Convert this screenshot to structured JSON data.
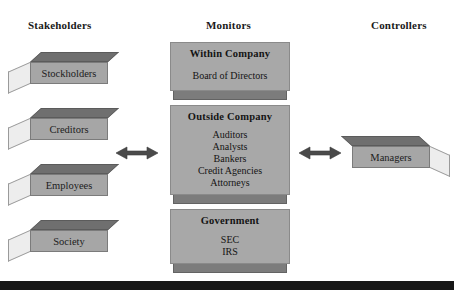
{
  "diagram": {
    "background_color": "#ffffff",
    "box_fill_color": "#a6a6a6",
    "box_top_color": "#6f6f6f",
    "box_side_color": "#ededed",
    "text_color": "#1a1a1a",
    "bottom_band_color": "#171717"
  },
  "columns": {
    "stakeholders": {
      "header": "Stakeholders",
      "boxes": [
        {
          "label": "Stockholders"
        },
        {
          "label": "Creditors"
        },
        {
          "label": "Employees"
        },
        {
          "label": "Society"
        }
      ]
    },
    "monitors": {
      "header": "Monitors",
      "panels": [
        {
          "title": "Within Company",
          "items": [
            "Board of Directors"
          ]
        },
        {
          "title": "Outside Company",
          "items": [
            "Auditors",
            "Analysts",
            "Bankers",
            "Credit Agencies",
            "Attorneys"
          ]
        },
        {
          "title": "Government",
          "items": [
            "SEC",
            "IRS"
          ]
        }
      ]
    },
    "controllers": {
      "header": "Controllers",
      "boxes": [
        {
          "label": "Managers"
        }
      ]
    }
  },
  "connectors": [
    {
      "name": "stakeholders-monitors-arrow",
      "type": "double-arrow"
    },
    {
      "name": "monitors-controllers-arrow",
      "type": "double-arrow"
    }
  ]
}
